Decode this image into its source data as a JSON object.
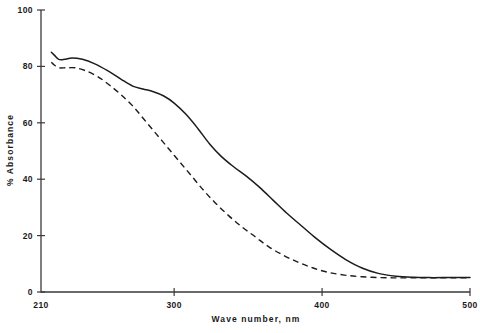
{
  "chart_data": {
    "type": "line",
    "title": "",
    "xlabel": "Wave number,  nm",
    "ylabel": "%  Absorbance",
    "xlim": [
      210,
      500
    ],
    "ylim": [
      0,
      100
    ],
    "grid": false,
    "legend": "none",
    "xticks": [
      210,
      300,
      400,
      500
    ],
    "yticks": [
      0,
      20,
      40,
      60,
      80,
      100
    ],
    "xtick_labels": [
      "210",
      "300",
      "400",
      "500"
    ],
    "ytick_labels": [
      "0",
      "20",
      "40",
      "60",
      "80",
      "100"
    ],
    "series": [
      {
        "name": "solid-curve",
        "style": "solid",
        "color": "#1c1c1c",
        "x": [
          217,
          219,
          222,
          226,
          231,
          238,
          246,
          255,
          264,
          272,
          279,
          286,
          293,
          300,
          308,
          316,
          324,
          332,
          340,
          349,
          358,
          367,
          376,
          386,
          396,
          406,
          416,
          427,
          438,
          450,
          462,
          472,
          482,
          494,
          500
        ],
        "y": [
          85,
          84,
          82.5,
          82.5,
          83,
          82.5,
          81,
          78.5,
          75.5,
          73,
          72,
          71,
          69.5,
          67,
          63,
          58,
          52.5,
          48,
          44.5,
          41,
          37,
          32.5,
          28,
          23.5,
          19,
          15,
          11.5,
          8.5,
          6.6,
          5.6,
          5.2,
          5.1,
          5.1,
          5.1,
          5.1
        ]
      },
      {
        "name": "dashed-curve",
        "style": "dashed",
        "color": "#1c1c1c",
        "x": [
          217,
          219,
          222,
          227,
          233,
          240,
          248,
          256,
          264,
          272,
          280,
          288,
          296,
          304,
          312,
          320,
          328,
          337,
          346,
          355,
          364,
          374,
          384,
          394,
          404,
          415,
          427,
          440,
          452,
          464,
          476,
          488,
          500
        ],
        "y": [
          81.5,
          80.5,
          79.5,
          79.5,
          79.5,
          78.5,
          76.5,
          73.5,
          70,
          66,
          61,
          56,
          51,
          46,
          41,
          36,
          31.5,
          27,
          23,
          19.5,
          16,
          13,
          10.5,
          8.5,
          7,
          6,
          5.4,
          5.1,
          5.0,
          5.0,
          5.0,
          5.0,
          5.0
        ]
      }
    ]
  },
  "layout": {
    "plot_x0": 41,
    "plot_x1": 470,
    "plot_y0": 292,
    "plot_y1": 10
  }
}
